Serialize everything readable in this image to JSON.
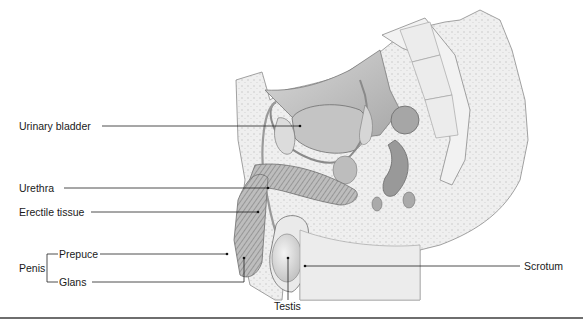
{
  "figure": {
    "type": "anatomical-diagram"
  },
  "labels": {
    "urinary_bladder": "Urinary bladder",
    "urethra": "Urethra",
    "erectile_tissue": "Erectile tissue",
    "penis": "Penis",
    "prepuce": "Prepuce",
    "glans": "Glans",
    "testis": "Testis",
    "scrotum": "Scrotum"
  },
  "colors": {
    "line": "#222222",
    "tissue_fill": "#e6e6e6",
    "tissue_dark": "#9a9a9a",
    "outline": "#7a7a7a",
    "rule": "#6e6e6e"
  }
}
